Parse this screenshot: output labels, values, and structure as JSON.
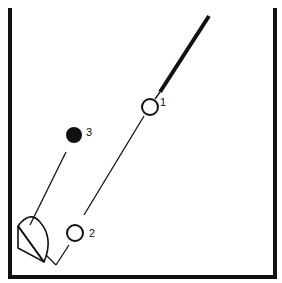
{
  "diagram": {
    "labels": {
      "node1": "1",
      "node2": "2",
      "node3": "3"
    },
    "colors": {
      "stroke": "#111111",
      "background": "#ffffff"
    }
  }
}
